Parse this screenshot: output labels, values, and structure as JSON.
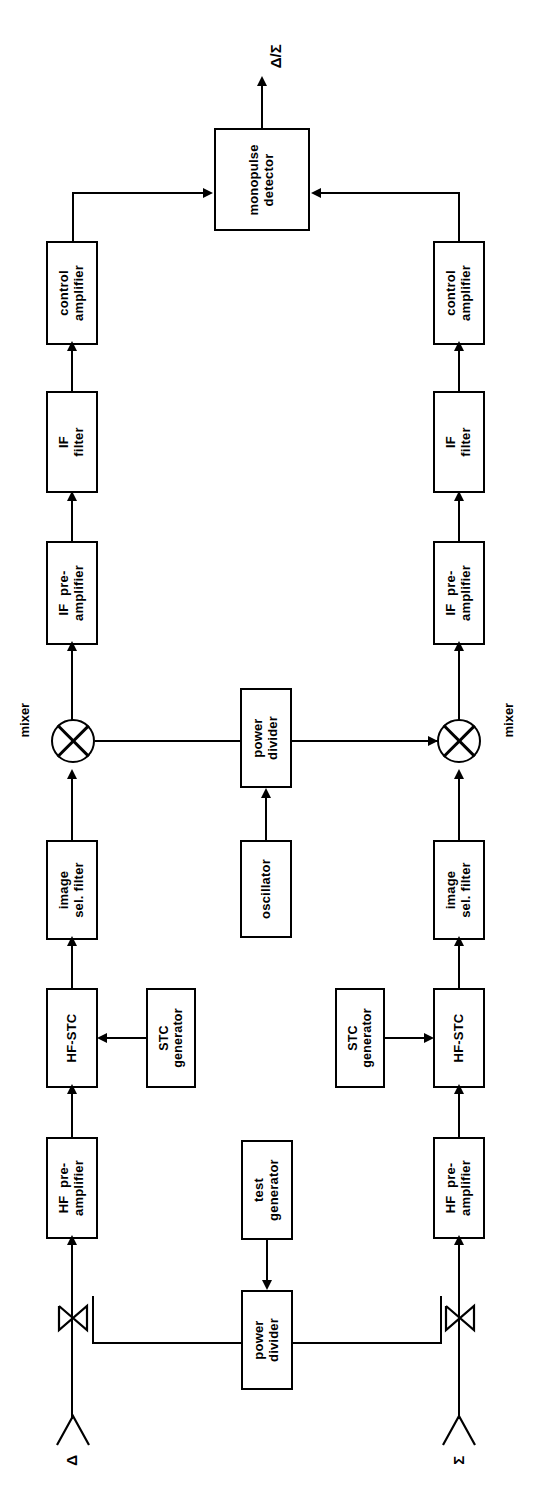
{
  "diagram": {
    "orientation": "rotated-90-ccw",
    "output_label": "Δ/Σ",
    "channels": [
      {
        "id": "delta",
        "port_label": "Δ",
        "mixer_label": "mixer",
        "blocks": [
          {
            "name": "hf-preamplifier",
            "label": "HF  pre-\namplifier"
          },
          {
            "name": "hf-stc",
            "label": "HF-STC"
          },
          {
            "name": "stc-generator",
            "label": "STC\ngenerator"
          },
          {
            "name": "image-sel-filter",
            "label": "image\nsel. filter"
          },
          {
            "name": "if-preamplifier",
            "label": "IF  pre-\namplifier"
          },
          {
            "name": "if-filter",
            "label": "IF\nfilter"
          },
          {
            "name": "control-amplifier",
            "label": "control\namplifier"
          }
        ]
      },
      {
        "id": "sigma",
        "port_label": "Σ",
        "mixer_label": "mixer",
        "blocks": [
          {
            "name": "hf-preamplifier",
            "label": "HF  pre-\namplifier"
          },
          {
            "name": "hf-stc",
            "label": "HF-STC"
          },
          {
            "name": "stc-generator",
            "label": "STC\ngenerator"
          },
          {
            "name": "image-sel-filter",
            "label": "image\nsel. filter"
          },
          {
            "name": "if-preamplifier",
            "label": "IF  pre-\namplifier"
          },
          {
            "name": "if-filter",
            "label": "IF\nfilter"
          },
          {
            "name": "control-amplifier",
            "label": "control\namplifier"
          }
        ]
      }
    ],
    "shared": {
      "monopulse_detector": "monopulse\ndetector",
      "lo_power_divider": "power\ndivider",
      "oscillator": "oscillator",
      "test_generator": "test\ngenerator",
      "test_power_divider": "power\ndivider"
    },
    "colors": {
      "line": "#000000",
      "background": "#ffffff",
      "block_fill": "#ffffff"
    }
  }
}
